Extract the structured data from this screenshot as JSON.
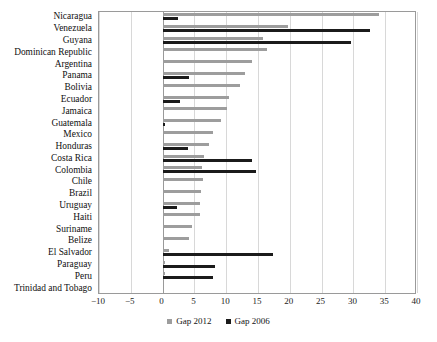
{
  "chart_data": {
    "type": "bar",
    "orientation": "horizontal",
    "title": "",
    "subtitle": "",
    "xlabel": "",
    "ylabel": "",
    "xlim": [
      -10,
      40
    ],
    "xticks": [
      -10,
      -5,
      0,
      5,
      10,
      15,
      20,
      25,
      30,
      35,
      40
    ],
    "xtick_labels": [
      "−10",
      "−5",
      "0",
      "5",
      "10",
      "15",
      "20",
      "25",
      "30",
      "35",
      "40"
    ],
    "grid": true,
    "grid_axis": "x",
    "legend_position": "bottom-center",
    "categories": [
      "Nicaragua",
      "Venezuela",
      "Guyana",
      "Dominican Republic",
      "Argentina",
      "Panama",
      "Bolivia",
      "Ecuador",
      "Jamaica",
      "Guatemala",
      "Mexico",
      "Honduras",
      "Costa Rica",
      "Colombia",
      "Chile",
      "Brazil",
      "Uruguay",
      "Haiti",
      "Suriname",
      "Belize",
      "El Salvador",
      "Paraguay",
      "Peru",
      "Trinidad and Tobago"
    ],
    "series": [
      {
        "name": "Gap 2012",
        "color": "#9d9d9d",
        "values": [
          34.0,
          19.7,
          15.8,
          16.4,
          14.0,
          13.0,
          12.1,
          10.4,
          10.2,
          9.2,
          8.0,
          7.3,
          6.5,
          6.2,
          6.3,
          6.0,
          5.9,
          5.9,
          4.6,
          4.2,
          1.0,
          0.4,
          0.3,
          0.0
        ]
      },
      {
        "name": "Gap 2006",
        "color": "#1b1b1b",
        "values": [
          2.5,
          32.6,
          29.7,
          0.0,
          0.0,
          4.1,
          0.0,
          2.8,
          0.0,
          0.3,
          0.0,
          4.0,
          14.0,
          14.7,
          0.0,
          0.0,
          2.2,
          0.0,
          0.0,
          0.0,
          17.4,
          8.3,
          8.0,
          0.0
        ]
      }
    ]
  },
  "legend": {
    "items": [
      {
        "label": "Gap 2012",
        "color": "#9d9d9d"
      },
      {
        "label": "Gap 2006",
        "color": "#1b1b1b"
      }
    ]
  }
}
